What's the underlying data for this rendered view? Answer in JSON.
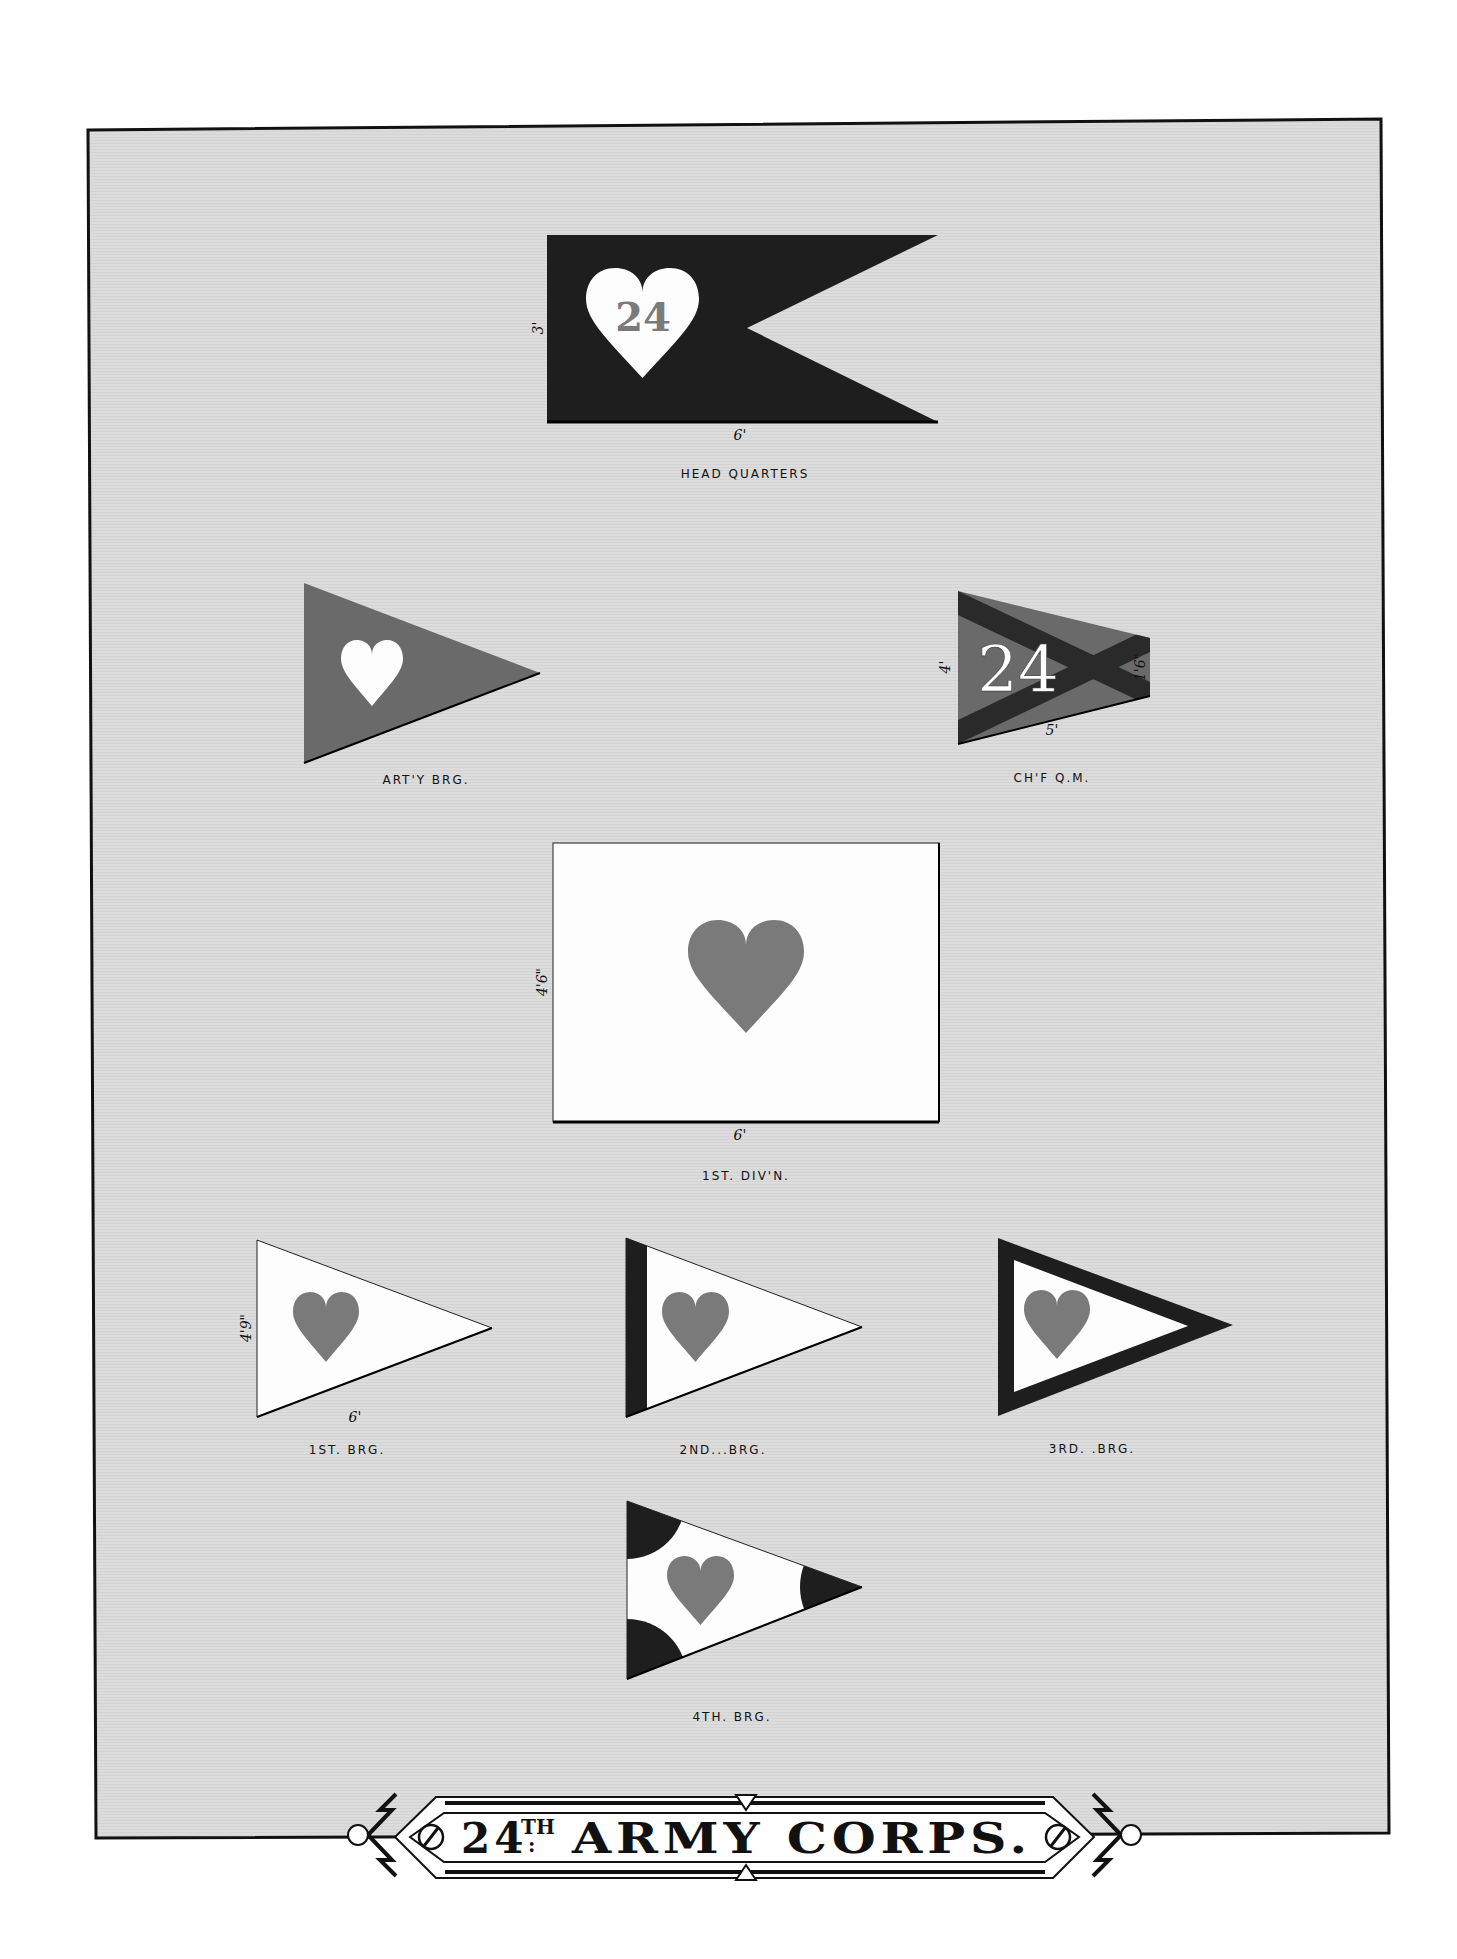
{
  "plate": {
    "title": {
      "number": "24",
      "suffix": "TH",
      "colon": ":",
      "text": "ARMY CORPS."
    },
    "colors": {
      "background": "#ffffff",
      "paper": "#dcdcdc",
      "frame": "#111111",
      "dark": "#1e1e1e",
      "medium": "#6a6a6a",
      "heart": "#7a7a7a",
      "white": "#fdfdfd"
    }
  },
  "flags": [
    {
      "id": "head-quarters",
      "label": "HEAD QUARTERS",
      "shape": "swallowtail",
      "field": "dark",
      "emblem": "white heart with numeral",
      "numeral": "24",
      "dimensions": {
        "hoist": "3'",
        "fly": "6'"
      }
    },
    {
      "id": "artillery-brigade",
      "label": "ART'Y BRG.",
      "shape": "triangle",
      "field": "medium",
      "emblem": "white heart"
    },
    {
      "id": "chief-quartermaster",
      "label": "CH'F Q.M.",
      "shape": "truncated-triangle",
      "field": "medium",
      "emblem": "dark saltire with white numeral",
      "numeral": "24",
      "dimensions": {
        "hoist": "4'",
        "fly": "5'",
        "end": "1'6\""
      }
    },
    {
      "id": "1st-division",
      "label": "1ST. DIV'N.",
      "shape": "rectangle",
      "field": "white",
      "emblem": "heart",
      "dimensions": {
        "hoist": "4'6\"",
        "fly": "6'"
      }
    },
    {
      "id": "1st-brigade",
      "label": "1ST. BRG.",
      "shape": "triangle",
      "field": "white",
      "emblem": "heart",
      "dimensions": {
        "hoist": "4'9\"",
        "fly": "6'"
      }
    },
    {
      "id": "2nd-brigade",
      "label": "2ND...BRG.",
      "shape": "triangle",
      "field": "white",
      "emblem": "heart",
      "border": "dark hoist stripe"
    },
    {
      "id": "3rd-brigade",
      "label": "3RD. .BRG.",
      "shape": "triangle",
      "field": "white",
      "emblem": "heart",
      "border": "dark border all sides"
    },
    {
      "id": "4th-brigade",
      "label": "4TH. BRG.",
      "shape": "triangle",
      "field": "white",
      "emblem": "heart",
      "border": "dark corner discs"
    }
  ]
}
